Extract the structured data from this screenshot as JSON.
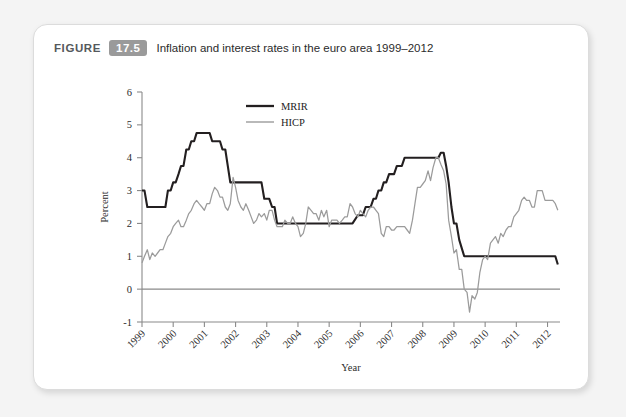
{
  "figure": {
    "label": "FIGURE",
    "number": "17.5",
    "title": "Inflation and interest rates in the euro area 1999–2012"
  },
  "colors": {
    "card_background": "#ffffff",
    "page_background": "#f4f4f4",
    "fignum_badge": "#9a9a9a",
    "mrir_line": "#231f20",
    "hicp_line": "#9b9b9b",
    "axis": "#8a8a8a"
  },
  "chart_data": {
    "type": "line",
    "title": "Inflation and interest rates in the euro area 1999–2012",
    "xlabel": "Year",
    "ylabel": "Percent",
    "ylim": [
      -1,
      6
    ],
    "yticks": [
      -1,
      0,
      1,
      2,
      3,
      4,
      5,
      6
    ],
    "xlim": [
      1999,
      2012.4
    ],
    "xticks": [
      1999,
      2000,
      2001,
      2002,
      2003,
      2004,
      2005,
      2006,
      2007,
      2008,
      2009,
      2010,
      2011,
      2012
    ],
    "xtick_labels": [
      "1999",
      "2000",
      "2001",
      "2002",
      "2003",
      "2004",
      "2005",
      "2006",
      "2007",
      "2008",
      "2009",
      "2010",
      "2011",
      "2012"
    ],
    "grid": false,
    "legend_position": "top-center",
    "zero_reference_line": 0,
    "series": [
      {
        "name": "MRIR",
        "color": "#231f20",
        "x": [
          1999.0,
          1999.08,
          1999.17,
          1999.25,
          1999.33,
          1999.42,
          1999.5,
          1999.58,
          1999.67,
          1999.75,
          1999.83,
          1999.92,
          2000.0,
          2000.08,
          2000.17,
          2000.25,
          2000.33,
          2000.42,
          2000.5,
          2000.58,
          2000.67,
          2000.75,
          2000.83,
          2000.92,
          2001.0,
          2001.08,
          2001.17,
          2001.25,
          2001.33,
          2001.42,
          2001.5,
          2001.58,
          2001.67,
          2001.75,
          2001.83,
          2001.92,
          2002.0,
          2002.08,
          2002.17,
          2002.25,
          2002.33,
          2002.42,
          2002.5,
          2002.58,
          2002.67,
          2002.75,
          2002.83,
          2002.92,
          2003.0,
          2003.08,
          2003.17,
          2003.25,
          2003.33,
          2003.42,
          2003.5,
          2003.58,
          2003.67,
          2003.75,
          2003.83,
          2003.92,
          2004.0,
          2004.25,
          2004.5,
          2004.75,
          2005.0,
          2005.25,
          2005.5,
          2005.75,
          2005.92,
          2006.0,
          2006.08,
          2006.17,
          2006.25,
          2006.33,
          2006.42,
          2006.5,
          2006.58,
          2006.67,
          2006.75,
          2006.83,
          2006.92,
          2007.0,
          2007.08,
          2007.17,
          2007.25,
          2007.33,
          2007.42,
          2007.5,
          2007.58,
          2007.67,
          2007.75,
          2007.83,
          2007.92,
          2008.0,
          2008.25,
          2008.5,
          2008.58,
          2008.67,
          2008.75,
          2008.83,
          2008.92,
          2009.0,
          2009.08,
          2009.17,
          2009.25,
          2009.33,
          2009.42,
          2009.5,
          2009.75,
          2010.0,
          2010.5,
          2011.0,
          2011.25,
          2011.5,
          2011.75,
          2012.0,
          2012.25,
          2012.33
        ],
        "values": [
          3.0,
          3.0,
          2.5,
          2.5,
          2.5,
          2.5,
          2.5,
          2.5,
          2.5,
          2.5,
          3.0,
          3.0,
          3.25,
          3.25,
          3.5,
          3.75,
          3.75,
          4.25,
          4.25,
          4.5,
          4.5,
          4.75,
          4.75,
          4.75,
          4.75,
          4.75,
          4.75,
          4.5,
          4.5,
          4.5,
          4.5,
          4.25,
          4.25,
          3.75,
          3.25,
          3.25,
          3.25,
          3.25,
          3.25,
          3.25,
          3.25,
          3.25,
          3.25,
          3.25,
          3.25,
          3.25,
          3.25,
          2.75,
          2.75,
          2.75,
          2.5,
          2.5,
          2.0,
          2.0,
          2.0,
          2.0,
          2.0,
          2.0,
          2.0,
          2.0,
          2.0,
          2.0,
          2.0,
          2.0,
          2.0,
          2.0,
          2.0,
          2.0,
          2.25,
          2.25,
          2.25,
          2.5,
          2.5,
          2.5,
          2.75,
          2.75,
          3.0,
          3.0,
          3.25,
          3.25,
          3.5,
          3.5,
          3.5,
          3.75,
          3.75,
          3.75,
          4.0,
          4.0,
          4.0,
          4.0,
          4.0,
          4.0,
          4.0,
          4.0,
          4.0,
          4.0,
          4.15,
          4.15,
          3.75,
          3.25,
          2.5,
          2.0,
          2.0,
          1.5,
          1.25,
          1.0,
          1.0,
          1.0,
          1.0,
          1.0,
          1.0,
          1.0,
          1.0,
          1.0,
          1.0,
          1.0,
          1.0,
          0.75
        ],
        "note": "Main Refinancing Interest Rate — stepped policy rate, peaks 4.75 in 2000–2001, 4.15 in 2008, falls to 1.0 in 2009, 0.75 at end of 2012"
      },
      {
        "name": "HICP",
        "color": "#9b9b9b",
        "x": [
          1999.0,
          1999.08,
          1999.17,
          1999.25,
          1999.33,
          1999.42,
          1999.5,
          1999.58,
          1999.67,
          1999.75,
          1999.83,
          1999.92,
          2000.0,
          2000.08,
          2000.17,
          2000.25,
          2000.33,
          2000.42,
          2000.5,
          2000.58,
          2000.67,
          2000.75,
          2000.83,
          2000.92,
          2001.0,
          2001.08,
          2001.17,
          2001.25,
          2001.33,
          2001.42,
          2001.5,
          2001.58,
          2001.67,
          2001.75,
          2001.83,
          2001.92,
          2002.0,
          2002.08,
          2002.17,
          2002.25,
          2002.33,
          2002.42,
          2002.5,
          2002.58,
          2002.67,
          2002.75,
          2002.83,
          2002.92,
          2003.0,
          2003.08,
          2003.17,
          2003.25,
          2003.33,
          2003.42,
          2003.5,
          2003.58,
          2003.67,
          2003.75,
          2003.83,
          2003.92,
          2004.0,
          2004.08,
          2004.17,
          2004.25,
          2004.33,
          2004.42,
          2004.5,
          2004.58,
          2004.67,
          2004.75,
          2004.83,
          2004.92,
          2005.0,
          2005.08,
          2005.17,
          2005.25,
          2005.33,
          2005.42,
          2005.5,
          2005.58,
          2005.67,
          2005.75,
          2005.83,
          2005.92,
          2006.0,
          2006.08,
          2006.17,
          2006.25,
          2006.33,
          2006.42,
          2006.5,
          2006.58,
          2006.67,
          2006.75,
          2006.83,
          2006.92,
          2007.0,
          2007.08,
          2007.17,
          2007.25,
          2007.33,
          2007.42,
          2007.5,
          2007.58,
          2007.67,
          2007.75,
          2007.83,
          2007.92,
          2008.0,
          2008.08,
          2008.17,
          2008.25,
          2008.33,
          2008.42,
          2008.5,
          2008.58,
          2008.67,
          2008.75,
          2008.83,
          2008.92,
          2009.0,
          2009.08,
          2009.17,
          2009.25,
          2009.33,
          2009.42,
          2009.5,
          2009.58,
          2009.67,
          2009.75,
          2009.83,
          2009.92,
          2010.0,
          2010.08,
          2010.17,
          2010.25,
          2010.33,
          2010.42,
          2010.5,
          2010.58,
          2010.67,
          2010.75,
          2010.83,
          2010.92,
          2011.0,
          2011.08,
          2011.17,
          2011.25,
          2011.33,
          2011.42,
          2011.5,
          2011.58,
          2011.67,
          2011.75,
          2011.83,
          2011.92,
          2012.0,
          2012.08,
          2012.17,
          2012.25,
          2012.33
        ],
        "values": [
          0.8,
          1.0,
          1.2,
          0.9,
          1.1,
          1.0,
          1.1,
          1.2,
          1.2,
          1.4,
          1.6,
          1.7,
          1.9,
          2.0,
          2.1,
          1.9,
          1.9,
          2.1,
          2.3,
          2.4,
          2.6,
          2.7,
          2.6,
          2.5,
          2.4,
          2.6,
          2.6,
          2.9,
          3.1,
          3.0,
          2.8,
          2.8,
          2.5,
          2.4,
          2.6,
          3.4,
          3.1,
          2.7,
          2.5,
          2.4,
          2.6,
          2.4,
          2.2,
          2.0,
          2.1,
          2.3,
          2.2,
          2.3,
          2.1,
          2.4,
          2.4,
          2.1,
          1.9,
          1.9,
          1.9,
          2.1,
          2.0,
          2.0,
          2.2,
          2.0,
          1.9,
          1.6,
          1.7,
          2.0,
          2.5,
          2.4,
          2.3,
          2.3,
          2.1,
          2.4,
          2.2,
          2.4,
          1.9,
          2.1,
          2.1,
          2.1,
          2.0,
          2.1,
          2.2,
          2.2,
          2.6,
          2.5,
          2.3,
          2.2,
          2.4,
          2.3,
          2.2,
          2.4,
          2.5,
          2.5,
          2.4,
          2.3,
          1.7,
          1.6,
          1.9,
          1.9,
          1.8,
          1.8,
          1.9,
          1.9,
          1.9,
          1.9,
          1.8,
          1.7,
          2.1,
          2.6,
          3.1,
          3.1,
          3.2,
          3.3,
          3.6,
          3.3,
          3.7,
          4.0,
          4.0,
          3.8,
          3.6,
          3.2,
          2.1,
          1.6,
          1.1,
          1.2,
          0.6,
          0.6,
          0.0,
          -0.1,
          -0.7,
          -0.2,
          -0.3,
          -0.1,
          0.5,
          0.9,
          1.0,
          0.9,
          1.4,
          1.5,
          1.6,
          1.4,
          1.7,
          1.6,
          1.8,
          1.9,
          1.9,
          2.2,
          2.3,
          2.4,
          2.7,
          2.8,
          2.7,
          2.7,
          2.5,
          2.5,
          3.0,
          3.0,
          3.0,
          2.7,
          2.7,
          2.7,
          2.7,
          2.6,
          2.4
        ],
        "note": "Harmonised Index of Consumer Prices inflation — peaks 4.0 mid-2008, troughs -0.7 mid-2009, ends near 2.4"
      }
    ],
    "legend": [
      {
        "label": "MRIR",
        "color": "#231f20"
      },
      {
        "label": "HICP",
        "color": "#9b9b9b"
      }
    ]
  }
}
